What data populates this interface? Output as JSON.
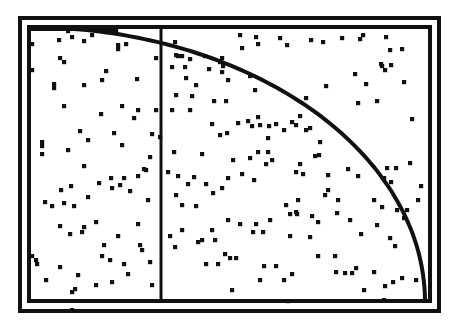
{
  "chart_data": {
    "type": "scatter",
    "title": "",
    "xlabel": "",
    "ylabel": "",
    "xlim": [
      0,
      1
    ],
    "ylim": [
      0,
      1
    ],
    "grid": false,
    "legend": null,
    "frame": {
      "outer": [
        18,
        16,
        441,
        313
      ],
      "inner": [
        27,
        25,
        432,
        303
      ]
    },
    "vertical_line_x": 161,
    "arc": {
      "cx": 28,
      "cy": 302,
      "rx": 397,
      "ry": 275
    },
    "colors": {
      "foreground": "#111111",
      "background": "#ffffff"
    },
    "points": [
      [
        68,
        31
      ],
      [
        88,
        29
      ],
      [
        92,
        29
      ],
      [
        96,
        29
      ],
      [
        100,
        29
      ],
      [
        104,
        29
      ],
      [
        108,
        29
      ],
      [
        112,
        30
      ],
      [
        116,
        31
      ],
      [
        72,
        37
      ],
      [
        92,
        35
      ],
      [
        59,
        40
      ],
      [
        84,
        41
      ],
      [
        118,
        45
      ],
      [
        118,
        49
      ],
      [
        126,
        44
      ],
      [
        32,
        44
      ],
      [
        32,
        70
      ],
      [
        60,
        58
      ],
      [
        64,
        62
      ],
      [
        156,
        58
      ],
      [
        106,
        71
      ],
      [
        137,
        79
      ],
      [
        84,
        85
      ],
      [
        102,
        80
      ],
      [
        54,
        84
      ],
      [
        54,
        88
      ],
      [
        64,
        106
      ],
      [
        122,
        106
      ],
      [
        138,
        110
      ],
      [
        156,
        110
      ],
      [
        101,
        114
      ],
      [
        134,
        118
      ],
      [
        80,
        131
      ],
      [
        88,
        140
      ],
      [
        122,
        145
      ],
      [
        42,
        142
      ],
      [
        42,
        146
      ],
      [
        152,
        134
      ],
      [
        160,
        137
      ],
      [
        42,
        154
      ],
      [
        68,
        150
      ],
      [
        114,
        133
      ],
      [
        84,
        166
      ],
      [
        146,
        170
      ],
      [
        124,
        178
      ],
      [
        112,
        188
      ],
      [
        138,
        176
      ],
      [
        61,
        190
      ],
      [
        64,
        203
      ],
      [
        71,
        186
      ],
      [
        99,
        183
      ],
      [
        111,
        178
      ],
      [
        88,
        197
      ],
      [
        45,
        202
      ],
      [
        52,
        206
      ],
      [
        74,
        206
      ],
      [
        60,
        226
      ],
      [
        82,
        232
      ],
      [
        96,
        222
      ],
      [
        118,
        236
      ],
      [
        138,
        224
      ],
      [
        70,
        234
      ],
      [
        84,
        227
      ],
      [
        120,
        185
      ],
      [
        150,
        157
      ],
      [
        144,
        169
      ],
      [
        130,
        191
      ],
      [
        148,
        200
      ],
      [
        104,
        245
      ],
      [
        140,
        245
      ],
      [
        124,
        264
      ],
      [
        142,
        250
      ],
      [
        102,
        256
      ],
      [
        110,
        260
      ],
      [
        150,
        262
      ],
      [
        60,
        267
      ],
      [
        72,
        292
      ],
      [
        96,
        285
      ],
      [
        78,
        275
      ],
      [
        128,
        274
      ],
      [
        36,
        260
      ],
      [
        32,
        256
      ],
      [
        37,
        264
      ],
      [
        46,
        280
      ],
      [
        112,
        282
      ],
      [
        152,
        285
      ],
      [
        75,
        289
      ],
      [
        72,
        310
      ],
      [
        175,
        42
      ],
      [
        176,
        55
      ],
      [
        178,
        56
      ],
      [
        182,
        56
      ],
      [
        190,
        59
      ],
      [
        172,
        67
      ],
      [
        185,
        67
      ],
      [
        186,
        78
      ],
      [
        205,
        56
      ],
      [
        220,
        62
      ],
      [
        222,
        58
      ],
      [
        240,
        35
      ],
      [
        256,
        37
      ],
      [
        258,
        44
      ],
      [
        242,
        48
      ],
      [
        176,
        95
      ],
      [
        192,
        96
      ],
      [
        190,
        110
      ],
      [
        172,
        110
      ],
      [
        196,
        85
      ],
      [
        209,
        69
      ],
      [
        222,
        72
      ],
      [
        223,
        66
      ],
      [
        228,
        80
      ],
      [
        214,
        101
      ],
      [
        226,
        101
      ],
      [
        250,
        76
      ],
      [
        255,
        90
      ],
      [
        238,
        123
      ],
      [
        248,
        121
      ],
      [
        252,
        126
      ],
      [
        260,
        125
      ],
      [
        212,
        124
      ],
      [
        227,
        133
      ],
      [
        202,
        154
      ],
      [
        174,
        152
      ],
      [
        220,
        135
      ],
      [
        258,
        117
      ],
      [
        269,
        126
      ],
      [
        168,
        172
      ],
      [
        178,
        176
      ],
      [
        194,
        177
      ],
      [
        206,
        184
      ],
      [
        213,
        193
      ],
      [
        188,
        184
      ],
      [
        176,
        195
      ],
      [
        182,
        205
      ],
      [
        196,
        206
      ],
      [
        233,
        160
      ],
      [
        242,
        174
      ],
      [
        254,
        180
      ],
      [
        266,
        164
      ],
      [
        272,
        160
      ],
      [
        268,
        152
      ],
      [
        258,
        152
      ],
      [
        268,
        138
      ],
      [
        250,
        158
      ],
      [
        284,
        130
      ],
      [
        276,
        124
      ],
      [
        292,
        122
      ],
      [
        300,
        116
      ],
      [
        306,
        130
      ],
      [
        320,
        142
      ],
      [
        315,
        156
      ],
      [
        300,
        164
      ],
      [
        228,
        178
      ],
      [
        222,
        188
      ],
      [
        182,
        230
      ],
      [
        170,
        236
      ],
      [
        175,
        247
      ],
      [
        198,
        242
      ],
      [
        202,
        240
      ],
      [
        212,
        230
      ],
      [
        215,
        240
      ],
      [
        225,
        254
      ],
      [
        230,
        258
      ],
      [
        236,
        258
      ],
      [
        228,
        220
      ],
      [
        240,
        224
      ],
      [
        253,
        232
      ],
      [
        256,
        224
      ],
      [
        263,
        232
      ],
      [
        270,
        220
      ],
      [
        286,
        205
      ],
      [
        290,
        214
      ],
      [
        296,
        212
      ],
      [
        290,
        236
      ],
      [
        206,
        264
      ],
      [
        218,
        264
      ],
      [
        264,
        266
      ],
      [
        276,
        266
      ],
      [
        284,
        280
      ],
      [
        260,
        280
      ],
      [
        292,
        274
      ],
      [
        232,
        290
      ],
      [
        288,
        301
      ],
      [
        280,
        38
      ],
      [
        287,
        45
      ],
      [
        311,
        40
      ],
      [
        323,
        42
      ],
      [
        342,
        38
      ],
      [
        360,
        39
      ],
      [
        363,
        35
      ],
      [
        386,
        37
      ],
      [
        390,
        50
      ],
      [
        402,
        49
      ],
      [
        381,
        64
      ],
      [
        355,
        74
      ],
      [
        382,
        66
      ],
      [
        385,
        70
      ],
      [
        391,
        65
      ],
      [
        366,
        84
      ],
      [
        404,
        82
      ],
      [
        326,
        86
      ],
      [
        306,
        98
      ],
      [
        358,
        103
      ],
      [
        377,
        101
      ],
      [
        412,
        119
      ],
      [
        296,
        125
      ],
      [
        310,
        128
      ],
      [
        319,
        155
      ],
      [
        296,
        172
      ],
      [
        303,
        174
      ],
      [
        328,
        175
      ],
      [
        348,
        169
      ],
      [
        358,
        176
      ],
      [
        387,
        168
      ],
      [
        384,
        178
      ],
      [
        391,
        182
      ],
      [
        396,
        168
      ],
      [
        410,
        163
      ],
      [
        328,
        190
      ],
      [
        325,
        195
      ],
      [
        338,
        200
      ],
      [
        337,
        213
      ],
      [
        374,
        200
      ],
      [
        382,
        207
      ],
      [
        397,
        210
      ],
      [
        407,
        210
      ],
      [
        404,
        218
      ],
      [
        298,
        200
      ],
      [
        297,
        214
      ],
      [
        312,
        216
      ],
      [
        318,
        222
      ],
      [
        310,
        237
      ],
      [
        350,
        220
      ],
      [
        377,
        225
      ],
      [
        361,
        234
      ],
      [
        390,
        238
      ],
      [
        395,
        246
      ],
      [
        318,
        256
      ],
      [
        335,
        256
      ],
      [
        336,
        272
      ],
      [
        345,
        273
      ],
      [
        352,
        273
      ],
      [
        356,
        268
      ],
      [
        374,
        272
      ],
      [
        364,
        290
      ],
      [
        385,
        286
      ],
      [
        393,
        282
      ],
      [
        402,
        278
      ],
      [
        384,
        300
      ],
      [
        416,
        280
      ],
      [
        418,
        200
      ],
      [
        421,
        186
      ]
    ]
  }
}
